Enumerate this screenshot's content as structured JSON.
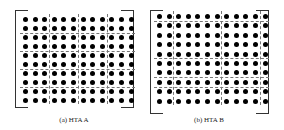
{
  "figure": {
    "panels": [
      {
        "id": "a",
        "caption": "(a) HTA A",
        "grid": {
          "rows": 10,
          "cols": 12
        },
        "vertical_dividers_after_col": [
          3,
          6,
          9
        ],
        "horizontal_dividers_after_row": [
          2,
          4,
          6,
          8
        ],
        "bracket": {
          "left": 15,
          "top": 10,
          "right": 133,
          "bottom": 106
        },
        "origin": {
          "x": 23,
          "y": 17
        },
        "step": {
          "x": 9.6,
          "y": 9.0
        },
        "caption_pos": {
          "x": 74,
          "y": 116
        }
      },
      {
        "id": "b",
        "caption": "(b) HTA B",
        "grid": {
          "rows": 10,
          "cols": 12
        },
        "vertical_dividers_after_col": [
          2,
          7,
          11
        ],
        "horizontal_dividers_after_row": [
          1,
          5,
          7,
          8
        ],
        "bracket": {
          "left": 150,
          "top": 10,
          "right": 268,
          "bottom": 112
        },
        "origin": {
          "x": 157,
          "y": 14
        },
        "step": {
          "x": 9.6,
          "y": 9.4
        },
        "caption_pos": {
          "x": 209,
          "y": 116
        }
      }
    ]
  }
}
